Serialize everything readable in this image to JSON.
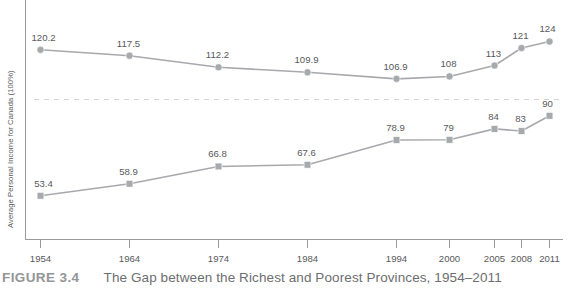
{
  "figure": {
    "number": "FIGURE 3.4",
    "caption": "The Gap between the Richest and Poorest Provinces, 1954–2011"
  },
  "chart_data": {
    "type": "line",
    "title": "The Gap between the Richest and Poorest Provinces, 1954–2011",
    "xlabel": "",
    "ylabel": "Average Personal Income for Canada (100%)",
    "categories": [
      "1954",
      "1964",
      "1974",
      "1984",
      "1994",
      "2000",
      "2005",
      "2008",
      "2011"
    ],
    "series": [
      {
        "name": "Richest province",
        "marker": "circle",
        "values": [
          120.2,
          117.5,
          112.2,
          109.9,
          106.9,
          108,
          113,
          121,
          124
        ],
        "labels": [
          "120.2",
          "117.5",
          "112.2",
          "109.9",
          "106.9",
          "108",
          "113",
          "121",
          "124"
        ]
      },
      {
        "name": "Poorest province",
        "marker": "square",
        "values": [
          53.4,
          58.9,
          66.8,
          67.6,
          78.9,
          79,
          84,
          83,
          90
        ],
        "labels": [
          "53.4",
          "58.9",
          "66.8",
          "67.6",
          "78.9",
          "79",
          "84",
          "83",
          "90"
        ]
      }
    ],
    "reference_line": {
      "value": 100,
      "style": "dashed",
      "label": "Canada average (100%)"
    },
    "ylim": [
      40,
      132
    ],
    "grid": false,
    "legend": "none",
    "colors": {
      "line": "#a7a9ac",
      "marker": "#a7a9ac",
      "axis": "#9a9b9e",
      "reference": "#d4d5d7",
      "text": "#58595b",
      "caption": "#6d6e71",
      "figure_number": "#939598"
    }
  }
}
